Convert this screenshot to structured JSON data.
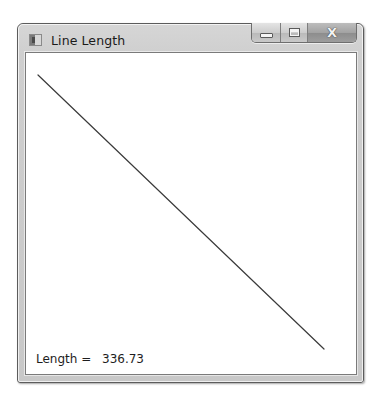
{
  "window": {
    "title": "Line Length",
    "app_icon": "window-app-icon",
    "caption_buttons": {
      "minimize_icon": "minimize-icon",
      "maximize_icon": "maximize-icon",
      "close_icon": "close-icon",
      "close_glyph": "X"
    }
  },
  "canvas": {
    "line": {
      "x1": 12,
      "y1": 22,
      "x2": 298,
      "y2": 296,
      "color": "#3a3a3a",
      "width": 1.2
    },
    "background": "#ffffff"
  },
  "status": {
    "length_label": "Length =",
    "length_value": "336.73"
  }
}
